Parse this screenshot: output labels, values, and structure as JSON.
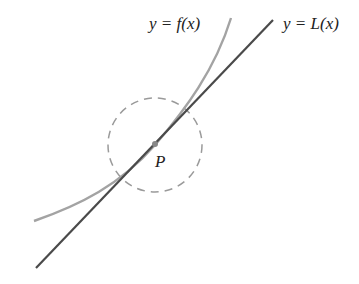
{
  "labels": {
    "curve": "y = f(x)",
    "tangent": "y = L(x)",
    "point": "P"
  },
  "colors": {
    "curve": "#a3a3a3",
    "tangent": "#4a4a4a",
    "circle": "#9a9a9a",
    "point": "#888888",
    "text": "#222222"
  },
  "geometry": {
    "point_P": [
      155,
      145
    ],
    "circle_radius": 47,
    "tangent_line": [
      [
        36,
        268
      ],
      [
        273,
        20
      ]
    ],
    "curve_points": [
      [
        34,
        221
      ],
      [
        90,
        200
      ],
      [
        130,
        172
      ],
      [
        155,
        145
      ],
      [
        185,
        110
      ],
      [
        212,
        65
      ],
      [
        231,
        18
      ]
    ]
  }
}
